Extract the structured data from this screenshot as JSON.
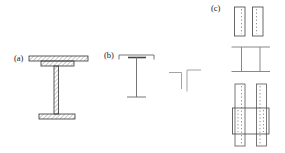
{
  "figure": {
    "labels": {
      "a": "(a)",
      "b": "(b)",
      "c": "(c)"
    },
    "sections": [
      {
        "id": "a",
        "label": "(a)",
        "shape": "riveted I-beam with top cover plate, hatched section"
      },
      {
        "id": "b",
        "label": "(b)",
        "shape": "T-section outline with two back-to-back angles"
      },
      {
        "id": "c",
        "label": "(c)",
        "shape": "built-up members: twin plates, channels toe-to-toe, battened twin channels with gusset plate"
      }
    ],
    "colors": {
      "background": "#ffffff",
      "outline_dark": "#333333",
      "hatch_line": "#777777",
      "medium_line": "#666666",
      "light_line": "#999999",
      "dashed_line": "#777777",
      "label_text": "#222222"
    }
  }
}
